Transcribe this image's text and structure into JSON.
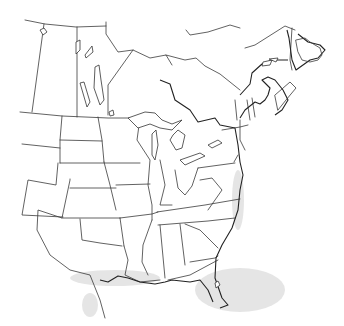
{
  "map": {
    "type": "outline-map",
    "region": "Eastern North America",
    "labels": [],
    "colors": {
      "background": "#ffffff",
      "borders": "#3a3a3a",
      "coast_shadow": "#cfcfcf"
    }
  }
}
